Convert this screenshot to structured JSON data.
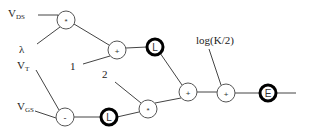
{
  "diagram": {
    "title": "",
    "inputs": [
      {
        "id": "vds",
        "main": "V",
        "sub": "DS",
        "x": 8,
        "y": 8
      },
      {
        "id": "lambda",
        "main": "λ",
        "sub": "",
        "x": 19,
        "y": 44
      },
      {
        "id": "vt",
        "main": "V",
        "sub": "T",
        "x": 17,
        "y": 60
      },
      {
        "id": "vgs",
        "main": "V",
        "sub": "GS",
        "x": 17,
        "y": 101
      },
      {
        "id": "one",
        "main": "1",
        "sub": "",
        "x": 70,
        "y": 61
      },
      {
        "id": "two",
        "main": "2",
        "sub": "",
        "x": 102,
        "y": 69
      },
      {
        "id": "logk2",
        "main": "log(K/2)",
        "sub": "",
        "x": 196,
        "y": 35
      }
    ],
    "nodes": [
      {
        "id": "mul1",
        "op": "*",
        "cx": 66,
        "cy": 20,
        "r": 9,
        "bold": false
      },
      {
        "id": "add1",
        "op": "+",
        "cx": 117,
        "cy": 50,
        "r": 9,
        "bold": false
      },
      {
        "id": "log1",
        "op": "L",
        "cx": 155,
        "cy": 47,
        "r": 8,
        "bold": true
      },
      {
        "id": "sub1",
        "op": "-",
        "cx": 65,
        "cy": 117,
        "r": 9,
        "bold": false
      },
      {
        "id": "log2",
        "op": "L",
        "cx": 109,
        "cy": 117,
        "r": 8,
        "bold": true
      },
      {
        "id": "mul2",
        "op": "*",
        "cx": 148,
        "cy": 109,
        "r": 9,
        "bold": false
      },
      {
        "id": "add2",
        "op": "+",
        "cx": 188,
        "cy": 92,
        "r": 9,
        "bold": false
      },
      {
        "id": "add3",
        "op": "+",
        "cx": 226,
        "cy": 93,
        "r": 9,
        "bold": false
      },
      {
        "id": "exp1",
        "op": "E",
        "cx": 268,
        "cy": 93,
        "r": 8,
        "bold": true
      }
    ],
    "edges": [
      {
        "x1": 38,
        "y1": 15,
        "x2": 58,
        "y2": 15
      },
      {
        "x1": 58,
        "y1": 15,
        "x2": 58,
        "y2": 17
      },
      {
        "x1": 37,
        "y1": 44,
        "x2": 60,
        "y2": 27
      },
      {
        "x1": 74,
        "y1": 24,
        "x2": 109,
        "y2": 45
      },
      {
        "x1": 83,
        "y1": 64,
        "x2": 110,
        "y2": 56
      },
      {
        "x1": 126,
        "y1": 48,
        "x2": 147,
        "y2": 47
      },
      {
        "x1": 160,
        "y1": 53,
        "x2": 182,
        "y2": 85
      },
      {
        "x1": 36,
        "y1": 70,
        "x2": 59,
        "y2": 110
      },
      {
        "x1": 35,
        "y1": 111,
        "x2": 56,
        "y2": 118
      },
      {
        "x1": 74,
        "y1": 117,
        "x2": 101,
        "y2": 117
      },
      {
        "x1": 117,
        "y1": 117,
        "x2": 139,
        "y2": 112
      },
      {
        "x1": 115,
        "y1": 82,
        "x2": 141,
        "y2": 103
      },
      {
        "x1": 155,
        "y1": 103,
        "x2": 181,
        "y2": 98
      },
      {
        "x1": 197,
        "y1": 92,
        "x2": 217,
        "y2": 92
      },
      {
        "x1": 209,
        "y1": 49,
        "x2": 221,
        "y2": 85
      },
      {
        "x1": 235,
        "y1": 93,
        "x2": 260,
        "y2": 93
      },
      {
        "x1": 276,
        "y1": 93,
        "x2": 296,
        "y2": 93
      }
    ]
  }
}
